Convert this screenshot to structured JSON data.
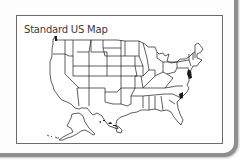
{
  "panel": {
    "title": "Standard US Map"
  },
  "map": {
    "type": "outline-us-states",
    "regions": [
      "Contiguous United States",
      "Alaska",
      "Hawaii"
    ],
    "line_color": "#1a1a1a",
    "background": "#ffffff"
  },
  "frame": {
    "border_color": "#6b6b6b",
    "shadow_border_color": "#8f8f8f"
  }
}
